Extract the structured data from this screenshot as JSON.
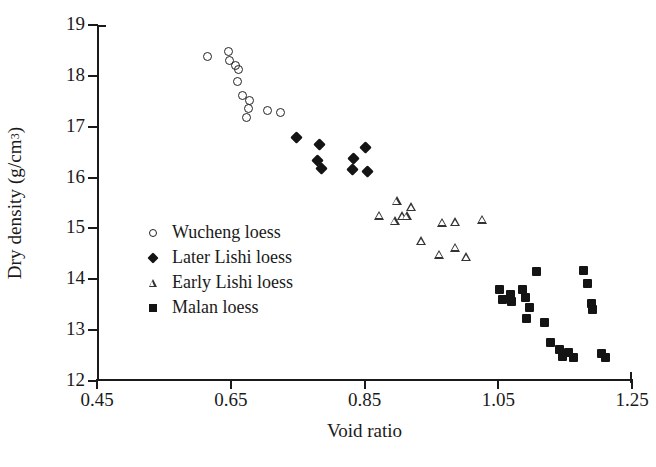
{
  "chart_data": {
    "type": "scatter",
    "title": "",
    "xlabel": "Void ratio",
    "ylabel": "Dry density (g/cm3)",
    "ylabel_base": "Dry density (g/cm",
    "ylabel_sup": "3",
    "ylabel_tail": ")",
    "xlim": [
      0.45,
      1.25
    ],
    "ylim": [
      12,
      19
    ],
    "xticks": [
      "0.45",
      "0.65",
      "0.85",
      "1.05",
      "1.25"
    ],
    "xtick_values": [
      0.45,
      0.65,
      0.85,
      1.05,
      1.25
    ],
    "yticks": [
      "19",
      "18",
      "17",
      "16",
      "15",
      "14",
      "13",
      "12"
    ],
    "ytick_values": [
      19,
      18,
      17,
      16,
      15,
      14,
      13,
      12
    ],
    "grid": false,
    "legend_position": "center-left",
    "series": [
      {
        "name": "Wucheng loess",
        "marker": "open-circle",
        "color": "#232323",
        "points": [
          [
            0.615,
            18.38
          ],
          [
            0.646,
            18.48
          ],
          [
            0.648,
            18.31
          ],
          [
            0.662,
            18.13
          ],
          [
            0.657,
            18.2
          ],
          [
            0.66,
            17.88
          ],
          [
            0.668,
            17.62
          ],
          [
            0.678,
            17.52
          ],
          [
            0.676,
            17.35
          ],
          [
            0.673,
            17.18
          ],
          [
            0.705,
            17.32
          ],
          [
            0.724,
            17.28
          ]
        ]
      },
      {
        "name": "Later Lishi loess",
        "marker": "filled-diamond",
        "color": "#141414",
        "points": [
          [
            0.748,
            16.78
          ],
          [
            0.782,
            16.65
          ],
          [
            0.78,
            16.34
          ],
          [
            0.785,
            16.17
          ],
          [
            0.833,
            16.37
          ],
          [
            0.832,
            16.16
          ],
          [
            0.851,
            16.6
          ],
          [
            0.854,
            16.11
          ]
        ]
      },
      {
        "name": "Early Lishi loess",
        "marker": "open-triangle",
        "color": "#333333",
        "points": [
          [
            0.872,
            15.26
          ],
          [
            0.898,
            15.55
          ],
          [
            0.895,
            15.15
          ],
          [
            0.906,
            15.25
          ],
          [
            0.913,
            15.25
          ],
          [
            0.92,
            15.43
          ],
          [
            0.935,
            14.76
          ],
          [
            0.966,
            15.12
          ],
          [
            0.962,
            14.49
          ],
          [
            0.985,
            15.13
          ],
          [
            0.985,
            14.63
          ],
          [
            1.002,
            14.44
          ],
          [
            1.026,
            15.18
          ]
        ]
      },
      {
        "name": "Malan loess",
        "marker": "filled-square",
        "color": "#141414",
        "points": [
          [
            1.052,
            13.8
          ],
          [
            1.056,
            13.61
          ],
          [
            1.068,
            13.71
          ],
          [
            1.07,
            13.56
          ],
          [
            1.086,
            13.79
          ],
          [
            1.091,
            13.64
          ],
          [
            1.096,
            13.44
          ],
          [
            1.107,
            14.15
          ],
          [
            1.119,
            13.16
          ],
          [
            1.128,
            12.75
          ],
          [
            1.141,
            12.61
          ],
          [
            1.146,
            12.48
          ],
          [
            1.155,
            12.56
          ],
          [
            1.162,
            12.47
          ],
          [
            1.178,
            14.18
          ],
          [
            1.184,
            13.92
          ],
          [
            1.189,
            13.52
          ],
          [
            1.191,
            13.41
          ],
          [
            1.204,
            12.54
          ],
          [
            1.21,
            12.47
          ],
          [
            1.092,
            13.22
          ]
        ]
      }
    ]
  },
  "legend": {
    "items": [
      {
        "label": "Wucheng loess",
        "marker": "open-circle"
      },
      {
        "label": "Later Lishi loess",
        "marker": "filled-diamond"
      },
      {
        "label": "Early Lishi loess",
        "marker": "open-triangle"
      },
      {
        "label": "Malan loess",
        "marker": "filled-square"
      }
    ]
  }
}
